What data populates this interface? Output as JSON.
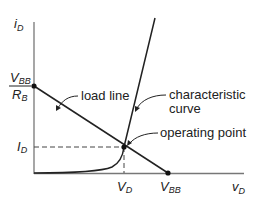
{
  "diagram": {
    "y_axis_label": "i",
    "y_axis_sub": "D",
    "x_axis_label": "v",
    "x_axis_sub": "D",
    "intercept_y_num": "V",
    "intercept_y_num_sub": "BB",
    "intercept_y_den": "R",
    "intercept_y_den_sub": "B",
    "id_label": "I",
    "id_sub": "D",
    "vd_label": "V",
    "vd_sub": "D",
    "vbb_label": "V",
    "vbb_sub": "BB",
    "annotations": {
      "load_line": "load line",
      "characteristic_1": "characteristic",
      "characteristic_2": "curve",
      "operating_point": "operating point"
    },
    "colors": {
      "line": "#222222",
      "axis": "#777777"
    }
  }
}
